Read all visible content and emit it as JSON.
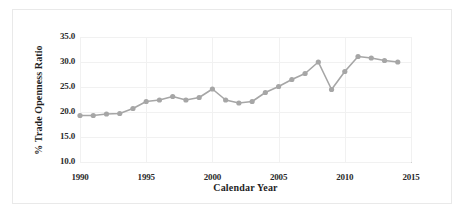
{
  "figure": {
    "background_color": "#ffffff",
    "border_color": "#e9e9e9"
  },
  "chart_data": {
    "type": "line",
    "title": "",
    "xlabel": "Calendar Year",
    "ylabel": "% Trade Openness Ratio",
    "xlim": [
      1990,
      2015
    ],
    "ylim": [
      10.0,
      35.0
    ],
    "xticks": [
      "1990",
      "1995",
      "2000",
      "2005",
      "2010",
      "2015"
    ],
    "xtick_values": [
      1990,
      1995,
      2000,
      2005,
      2010,
      2015
    ],
    "yticks": [
      "10.0",
      "15.0",
      "20.0",
      "25.0",
      "30.0",
      "35.0"
    ],
    "ytick_values": [
      10.0,
      15.0,
      20.0,
      25.0,
      30.0,
      35.0
    ],
    "grid": true,
    "legend": "none",
    "series_color": "#a6a6a6",
    "marker": "circle",
    "x": [
      1990,
      1991,
      1992,
      1993,
      1994,
      1995,
      1996,
      1997,
      1998,
      1999,
      2000,
      2001,
      2002,
      2003,
      2004,
      2005,
      2006,
      2007,
      2008,
      2009,
      2010,
      2011,
      2012,
      2013,
      2014
    ],
    "values": [
      19.3,
      19.3,
      19.6,
      19.7,
      20.7,
      22.1,
      22.4,
      23.1,
      22.4,
      22.9,
      24.6,
      22.4,
      21.8,
      22.1,
      23.9,
      25.1,
      26.5,
      27.7,
      30.0,
      24.5,
      28.1,
      31.1,
      30.8,
      30.3,
      30.0
    ]
  }
}
